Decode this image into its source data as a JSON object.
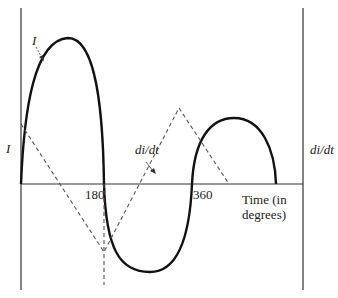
{
  "diagram": {
    "type": "waveform",
    "labels": {
      "current_curve": "I",
      "current_axis": "I",
      "derivative_curve": "di/dt",
      "derivative_axis": "di/dt",
      "tick_180": "180",
      "tick_360": "360",
      "x_axis_line1": "Time (in",
      "x_axis_line2": "degrees)"
    },
    "colors": {
      "curve": "#111111",
      "dashed": "#555555",
      "axis": "#333333"
    },
    "series": [
      {
        "name": "I",
        "style": "solid",
        "description": "current waveform; positive half 0–180, negative half 180–360, positive lobe after 360"
      },
      {
        "name": "di/dt",
        "style": "dashed",
        "description": "triangular derivative waveform; minimum at 180"
      }
    ]
  }
}
